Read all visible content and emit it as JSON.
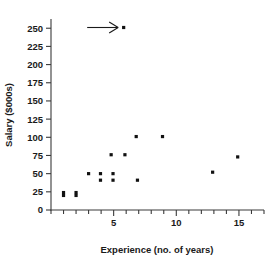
{
  "chart_data": {
    "type": "scatter",
    "title": "",
    "xlabel": "Experience (no. of years)",
    "ylabel": "Salary ($000s)",
    "xlim": [
      0,
      17
    ],
    "ylim": [
      0,
      262
    ],
    "grid": false,
    "legend": null,
    "x_ticks": [
      0,
      1,
      2,
      3,
      4,
      5,
      6,
      7,
      8,
      9,
      10,
      11,
      12,
      13,
      14,
      15,
      16,
      17
    ],
    "x_tick_labels": [
      "",
      "",
      "",
      "",
      "",
      "5",
      "",
      "",
      "",
      "",
      "10",
      "",
      "",
      "",
      "",
      "15",
      "",
      ""
    ],
    "y_ticks": [
      0,
      25,
      50,
      75,
      100,
      125,
      150,
      175,
      200,
      225,
      250
    ],
    "y_tick_labels": [
      "0",
      "25",
      "50",
      "75",
      "100",
      "125",
      "150",
      "175",
      "200",
      "225",
      "250"
    ],
    "points": [
      {
        "x": 1.0,
        "y": 24
      },
      {
        "x": 1.0,
        "y": 20
      },
      {
        "x": 2.0,
        "y": 24
      },
      {
        "x": 2.0,
        "y": 20
      },
      {
        "x": 3.0,
        "y": 50
      },
      {
        "x": 3.95,
        "y": 50
      },
      {
        "x": 3.95,
        "y": 41
      },
      {
        "x": 4.8,
        "y": 76
      },
      {
        "x": 4.95,
        "y": 50
      },
      {
        "x": 4.95,
        "y": 41
      },
      {
        "x": 5.8,
        "y": 251
      },
      {
        "x": 5.9,
        "y": 76
      },
      {
        "x": 6.8,
        "y": 101
      },
      {
        "x": 6.9,
        "y": 41
      },
      {
        "x": 8.9,
        "y": 101
      },
      {
        "x": 12.9,
        "y": 52
      },
      {
        "x": 14.9,
        "y": 73
      }
    ],
    "annotations": [
      {
        "name": "outlier-arrow",
        "kind": "arrow",
        "points_to": {
          "x": 5.8,
          "y": 251
        },
        "direction": "right",
        "text": ""
      }
    ],
    "marker": {
      "shape": "square",
      "color": "#111111",
      "size_px": 3.2
    },
    "axis_color": "#3a3a3a",
    "text_color": "#1a1a1a",
    "background": "#ffffff"
  }
}
